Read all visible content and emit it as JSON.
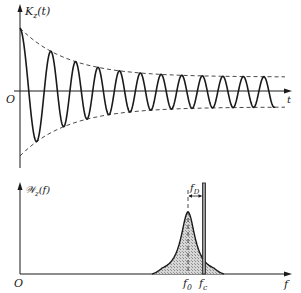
{
  "chart_data": [
    {
      "type": "line",
      "title": "",
      "ylabel": "K_z(t)",
      "ylabel_display": "K",
      "ylabel_sub": "z",
      "ylabel_arg": "(t)",
      "xlabel": "t",
      "origin_label": "O",
      "description": "Damped oscillation of the autocorrelation function, decaying between dashed envelopes to a constant-amplitude sinusoid",
      "grid": false,
      "series": [
        {
          "name": "K_z(t)",
          "style": "solid",
          "shape": "decaying cosine settling to steady oscillation"
        },
        {
          "name": "upper envelope",
          "style": "dashed"
        },
        {
          "name": "lower envelope",
          "style": "dashed"
        }
      ],
      "approx_peaks_x_px": [
        20,
        55,
        80,
        105,
        128,
        147,
        167,
        187,
        207,
        227,
        247,
        268
      ],
      "steady_amplitude_ratio": 0.24
    },
    {
      "type": "area",
      "title": "",
      "ylabel": "W_z(f)",
      "ylabel_display": "W",
      "ylabel_sub": "z",
      "ylabel_arg": "(f)",
      "xlabel": "f",
      "origin_label": "O",
      "description": "Power spectral density: hatched resonance peak centered at f0 plus a narrow spectral line at fc, separated by Doppler shift fD",
      "grid": false,
      "annotations": [
        {
          "text": "f0",
          "main": "f",
          "sub": "0",
          "role": "peak center frequency"
        },
        {
          "text": "fc",
          "main": "f",
          "sub": "c",
          "role": "carrier line frequency"
        },
        {
          "text": "fD",
          "main": "f",
          "sub": "D",
          "role": "offset between f0 and fc"
        }
      ]
    }
  ],
  "labels": {
    "top": {
      "y_main": "K",
      "y_sub": "z",
      "y_arg": "(t)",
      "x": "t",
      "origin": "O"
    },
    "bottom": {
      "y_main": "𝒲",
      "y_sub": "z",
      "y_arg": "(f)",
      "x": "f",
      "origin": "O",
      "f0_main": "f",
      "f0_sub": "0",
      "fc_main": "f",
      "fc_sub": "c",
      "fd_main": "f",
      "fd_sub": "D"
    }
  },
  "colors": {
    "ink": "#1a1a1a",
    "hatch_fill": "#bdbdbd",
    "background": "#ffffff"
  }
}
